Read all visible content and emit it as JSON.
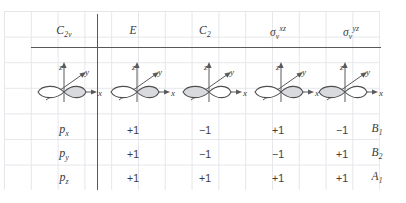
{
  "table": {
    "point_group": "C",
    "point_group_sub": "2v",
    "columns": [
      {
        "name": "point-group",
        "label_main": "C",
        "label_sub": "2v",
        "label_sup": ""
      },
      {
        "name": "identity",
        "label_main": "E",
        "label_sub": "",
        "label_sup": ""
      },
      {
        "name": "c2-rotation",
        "label_main": "C",
        "label_sub": "2",
        "label_sup": ""
      },
      {
        "name": "sigma-v-xz",
        "label_main": "σ",
        "label_sub": "v",
        "label_sup": "xz"
      },
      {
        "name": "sigma-v-yz",
        "label_main": "σ",
        "label_sub": "v",
        "label_sup": "yz"
      }
    ],
    "orbital_row": {
      "axis_labels": {
        "z": "z",
        "y": "y",
        "x": "x"
      },
      "diagrams": [
        {
          "column": "point-group",
          "shaded_lobe": "right"
        },
        {
          "column": "identity",
          "shaded_lobe": "right"
        },
        {
          "column": "c2-rotation",
          "shaded_lobe": "left"
        },
        {
          "column": "sigma-v-xz",
          "shaded_lobe": "right"
        },
        {
          "column": "sigma-v-yz",
          "shaded_lobe": "left"
        }
      ]
    },
    "rows": [
      {
        "orbital_main": "p",
        "orbital_sub": "x",
        "values": [
          "+1",
          "−1",
          "+1",
          "−1"
        ],
        "symmetry_main": "B",
        "symmetry_sub": "1"
      },
      {
        "orbital_main": "p",
        "orbital_sub": "y",
        "values": [
          "+1",
          "−1",
          "−1",
          "+1"
        ],
        "symmetry_main": "B",
        "symmetry_sub": "2"
      },
      {
        "orbital_main": "p",
        "orbital_sub": "z",
        "values": [
          "+1",
          "+1",
          "+1",
          "+1"
        ],
        "symmetry_main": "A",
        "symmetry_sub": "1"
      }
    ]
  },
  "colors": {
    "grid_line": "#e4e6ea",
    "rule": "#585858",
    "text": "#3a3a3a",
    "lobe_fill": "#d9dade",
    "lobe_stroke": "#5a5a5c"
  }
}
